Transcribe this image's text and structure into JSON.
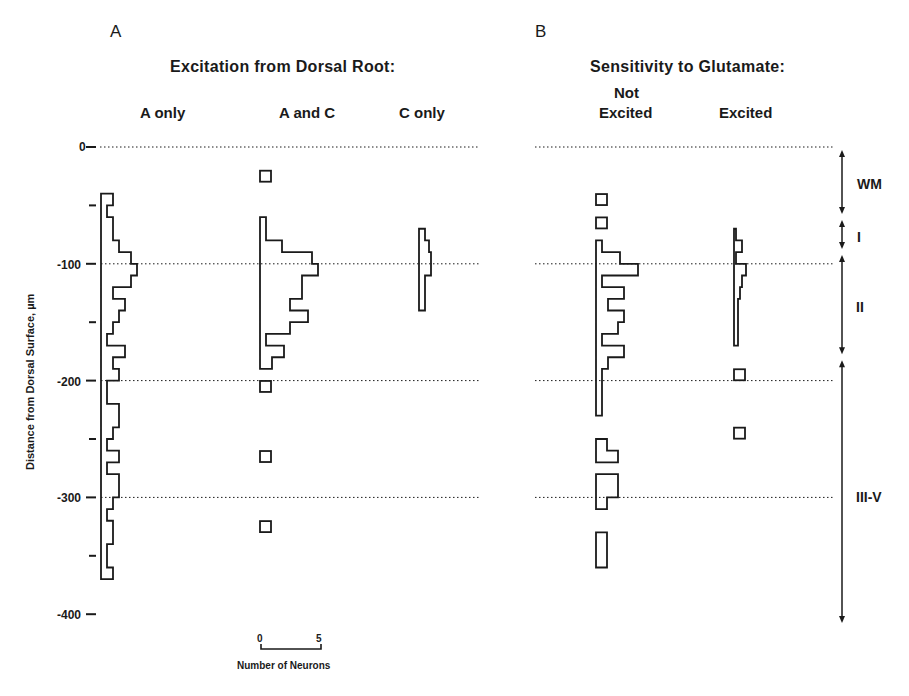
{
  "panels": {
    "A": {
      "label": "A",
      "title": "Excitation from Dorsal Root:"
    },
    "B": {
      "label": "B",
      "title": "Sensitivity to Glutamate:"
    }
  },
  "columns": {
    "a_only": "A only",
    "a_and_c": "A and C",
    "c_only": "C only",
    "not_excited_line1": "Not",
    "not_excited_line2": "Excited",
    "excited": "Excited"
  },
  "y_axis": {
    "label": "Distance from Dorsal Surface, µm",
    "ticks": [
      "0",
      "-100",
      "-200",
      "-300",
      "-400"
    ]
  },
  "scale_bar": {
    "min": "0",
    "max": "5",
    "label": "Number of Neurons"
  },
  "layers": [
    {
      "name": "WM",
      "from": 0,
      "to": -60
    },
    {
      "name": "I",
      "from": -60,
      "to": -90
    },
    {
      "name": "II",
      "from": -90,
      "to": -180
    },
    {
      "name": "III-V",
      "from": -180,
      "to": -410
    }
  ],
  "colors": {
    "ink": "#1a1a1a",
    "background": "#ffffff"
  },
  "chart_data": {
    "type": "bar",
    "xlabel": "Number of Neurons",
    "ylabel": "Distance from Dorsal Surface, µm",
    "ylim": [
      -400,
      0
    ],
    "bin_width_um": 10,
    "gridlines_y": [
      0,
      -100,
      -200,
      -300
    ],
    "orientation": "horizontal",
    "series": [
      {
        "name": "A only",
        "panel": "A",
        "bins_top": [
          -40,
          -50,
          -60,
          -80,
          -90,
          -100,
          -110,
          -120,
          -130,
          -140,
          -150,
          -160,
          -170,
          -180,
          -190,
          -200,
          -220,
          -240,
          -250,
          -260,
          -270,
          -280,
          -300,
          -310,
          -320,
          -340,
          -360
        ],
        "counts": [
          6,
          3,
          6,
          9,
          15,
          18,
          15,
          6,
          12,
          9,
          6,
          3,
          12,
          6,
          9,
          3,
          9,
          6,
          3,
          9,
          3,
          9,
          6,
          3,
          6,
          3,
          6
        ],
        "bins_bottom": [
          -50,
          -60,
          -80,
          -90,
          -100,
          -110,
          -120,
          -130,
          -140,
          -150,
          -160,
          -170,
          -180,
          -190,
          -200,
          -220,
          -240,
          -250,
          -260,
          -270,
          -280,
          -300,
          -310,
          -320,
          -340,
          -360,
          -370
        ]
      },
      {
        "name": "A and C",
        "panel": "A",
        "bins_top": [
          -60,
          -80,
          -90,
          -100,
          -110,
          -120,
          -130,
          -140,
          -150,
          -160,
          -170,
          -180
        ],
        "counts": [
          3,
          11,
          26,
          29,
          21,
          21,
          15,
          24,
          15,
          3,
          12,
          6
        ],
        "bins_bottom": [
          -80,
          -90,
          -100,
          -110,
          -120,
          -130,
          -140,
          -150,
          -160,
          -170,
          -180,
          -190
        ],
        "isolated": [
          {
            "depth": -25,
            "count": 1
          },
          {
            "depth": -205,
            "count": 1
          },
          {
            "depth": -265,
            "count": 1
          },
          {
            "depth": -325,
            "count": 1
          }
        ]
      },
      {
        "name": "C only",
        "panel": "A",
        "bins_top": [
          -70,
          -80,
          -90,
          -110
        ],
        "counts": [
          3,
          5,
          6,
          3
        ],
        "bins_bottom": [
          -80,
          -90,
          -110,
          -140
        ]
      },
      {
        "name": "Not Excited",
        "panel": "B",
        "bins_top": [
          -80,
          -90,
          -100,
          -110,
          -120,
          -130,
          -140,
          -150,
          -160,
          -170,
          -180,
          -190
        ],
        "counts": [
          3,
          12,
          21,
          3,
          14,
          6,
          14,
          11,
          3,
          14,
          6,
          3
        ],
        "bins_bottom": [
          -90,
          -100,
          -110,
          -120,
          -130,
          -140,
          -150,
          -160,
          -170,
          -180,
          -190,
          -230
        ],
        "isolated": [
          {
            "depth": -45,
            "count": 1
          },
          {
            "depth": -65,
            "count": 1
          }
        ],
        "fragments": [
          {
            "segments": [
              {
                "top": -250,
                "bottom": -260,
                "count": 1
              },
              {
                "top": -260,
                "bottom": -270,
                "count": 2
              }
            ]
          },
          {
            "segments": [
              {
                "top": -280,
                "bottom": -300,
                "count": 2
              },
              {
                "top": -300,
                "bottom": -310,
                "count": 1
              }
            ]
          },
          {
            "segments": [
              {
                "top": -330,
                "bottom": -360,
                "count": 1
              }
            ]
          }
        ]
      },
      {
        "name": "Excited",
        "panel": "B",
        "bins_top": [
          -70,
          -80,
          -90,
          -100,
          -110,
          -120,
          -130
        ],
        "counts": [
          1,
          4,
          1,
          6,
          4,
          3,
          2
        ],
        "bins_bottom": [
          -80,
          -90,
          -100,
          -110,
          -120,
          -130,
          -170
        ],
        "isolated": [
          {
            "depth": -195,
            "count": 1
          },
          {
            "depth": -245,
            "count": 1
          }
        ]
      }
    ]
  }
}
